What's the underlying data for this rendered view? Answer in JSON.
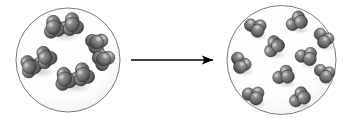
{
  "figure": {
    "type": "chemistry-particulate-diagram",
    "background_color": "#ffffff"
  },
  "colors": {
    "sphere_fill": "#6a6a6a",
    "sphere_highlight": "#b9b9b9",
    "sphere_shade": "#3c3c3c",
    "sphere_outline": "#2e2e2e",
    "container_outline": "#6b6b6b",
    "arrow_color": "#000000",
    "shadow_color": "#bdbdbd"
  },
  "containers": [
    {
      "name": "reactant-container",
      "label": "left circle",
      "cx": 68,
      "cy": 60,
      "r": 52,
      "molecule_count": 4,
      "molecule_kind": "dimer"
    },
    {
      "name": "product-container",
      "label": "right circle",
      "cx": 281.5,
      "cy": 60,
      "r": 54.5,
      "molecule_count": 8,
      "molecule_kind": "monomer"
    }
  ],
  "arrow": {
    "name": "reaction-arrow",
    "direction": "right",
    "x_start": 131,
    "x_end": 213,
    "y": 60,
    "line_width": 1.4,
    "head_length": 11,
    "head_width": 9
  },
  "reactant_molecules": [
    {
      "id": "dimer-1",
      "cx": 63,
      "cy": 27,
      "rotation": -8,
      "scale": 1.0
    },
    {
      "id": "dimer-2",
      "cx": 38,
      "cy": 63,
      "rotation": -30,
      "scale": 0.97
    },
    {
      "id": "dimer-3",
      "cx": 99,
      "cy": 51,
      "rotation": 68,
      "scale": 0.97
    },
    {
      "id": "dimer-4",
      "cx": 74,
      "cy": 78,
      "rotation": -14,
      "scale": 1.0
    }
  ],
  "product_molecules": [
    {
      "id": "monomer-1",
      "cx": 256,
      "cy": 27,
      "rotation": 35,
      "scale": 1.0
    },
    {
      "id": "monomer-2",
      "cx": 297,
      "cy": 21,
      "rotation": -20,
      "scale": 1.0
    },
    {
      "id": "monomer-3",
      "cx": 324,
      "cy": 38,
      "rotation": 60,
      "scale": 0.96
    },
    {
      "id": "monomer-4",
      "cx": 274,
      "cy": 46,
      "rotation": -40,
      "scale": 1.0
    },
    {
      "id": "monomer-5",
      "cx": 307,
      "cy": 56,
      "rotation": 15,
      "scale": 1.0
    },
    {
      "id": "monomer-6",
      "cx": 241,
      "cy": 63,
      "rotation": 70,
      "scale": 1.0
    },
    {
      "id": "monomer-7",
      "cx": 284,
      "cy": 75,
      "rotation": -10,
      "scale": 1.0
    },
    {
      "id": "monomer-8",
      "cx": 325,
      "cy": 73,
      "rotation": 45,
      "scale": 0.96
    },
    {
      "id": "monomer-9",
      "cx": 254,
      "cy": 95,
      "rotation": 25,
      "scale": 1.0
    },
    {
      "id": "monomer-10",
      "cx": 300,
      "cy": 97,
      "rotation": -25,
      "scale": 1.0
    }
  ],
  "geometry": {
    "dimer_sphere_radius": 7.2,
    "dimer_lobe_offset": 9.5,
    "monomer_sphere_radius": 6.6,
    "monomer_spread": 5.4
  }
}
